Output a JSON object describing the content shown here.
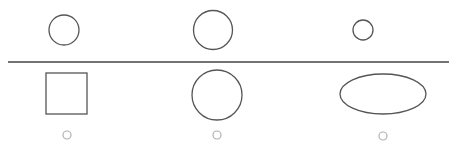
{
  "diagram": {
    "width": 452,
    "height": 148,
    "background": "#ffffff",
    "stroke_color": "#555555",
    "option_marker_color": "#b0b0b0",
    "divider": {
      "x1": 8,
      "y1": 62,
      "x2": 449,
      "y2": 62,
      "color": "#444444",
      "width": 1.3
    },
    "top_row": [
      {
        "id": "top-circle-small-left",
        "shape": "circle",
        "cx": 64,
        "cy": 30,
        "r": 15
      },
      {
        "id": "top-circle-large-middle",
        "shape": "circle",
        "cx": 213,
        "cy": 30,
        "r": 19.5
      },
      {
        "id": "top-circle-tiny-right",
        "shape": "circle",
        "cx": 363,
        "cy": 30,
        "r": 10
      }
    ],
    "bottom_row": [
      {
        "id": "option-square",
        "shape": "rect",
        "x": 46,
        "y": 73,
        "width": 41,
        "height": 41
      },
      {
        "id": "option-circle",
        "shape": "circle",
        "cx": 217,
        "cy": 95,
        "r": 25
      },
      {
        "id": "option-ellipse",
        "shape": "ellipse",
        "cx": 383,
        "cy": 94,
        "rx": 43,
        "ry": 20
      }
    ],
    "option_markers": [
      {
        "id": "marker-square",
        "cx": 67,
        "cy": 135,
        "r": 4
      },
      {
        "id": "marker-circle",
        "cx": 217,
        "cy": 135,
        "r": 4
      },
      {
        "id": "marker-ellipse",
        "cx": 383,
        "cy": 136,
        "r": 4
      }
    ]
  }
}
